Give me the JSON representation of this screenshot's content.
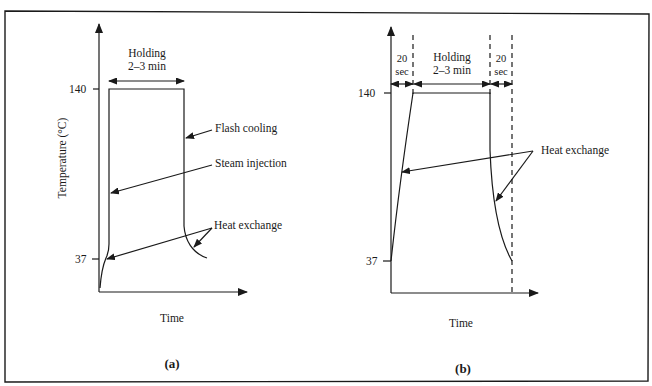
{
  "figure": {
    "panels": [
      {
        "id": "a",
        "caption": "(a)",
        "xlabel": "Time",
        "ylabel": "Temperature (°C)",
        "yticks": [
          "140",
          "37"
        ],
        "holding_label_line1": "Holding",
        "holding_label_line2": "2–3 min",
        "annotations": {
          "flash_cooling": "Flash cooling",
          "steam_injection": "Steam injection",
          "heat_exchange": "Heat exchange"
        }
      },
      {
        "id": "b",
        "caption": "(b)",
        "xlabel": "Time",
        "yticks": [
          "140",
          "37"
        ],
        "phase_left_line1": "20",
        "phase_left_line2": "sec",
        "holding_label_line1": "Holding",
        "holding_label_line2": "2–3 min",
        "phase_right_line1": "20",
        "phase_right_line2": "sec",
        "annotations": {
          "heat_exchange": "Heat exchange"
        }
      }
    ],
    "colors": {
      "ink": "#1a1a1a",
      "background": "#ffffff"
    }
  }
}
